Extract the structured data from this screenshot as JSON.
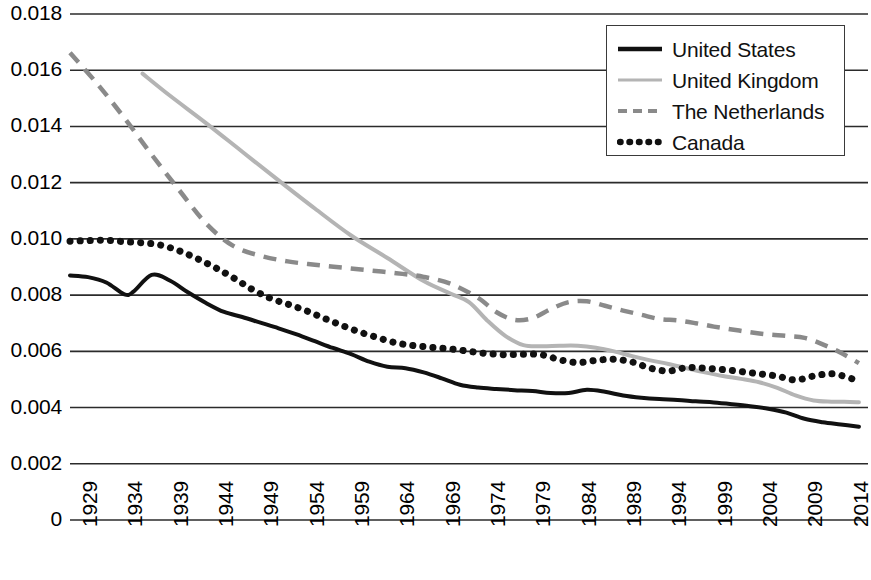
{
  "chart_data": {
    "type": "line",
    "title": "",
    "xlabel": "",
    "ylabel": "",
    "xlim": [
      1929,
      2017
    ],
    "ylim": [
      0,
      0.018
    ],
    "grid": "horizontal",
    "legend_position": "top-right",
    "x_ticks": [
      "1929",
      "1934",
      "1939",
      "1944",
      "1949",
      "1954",
      "1959",
      "1964",
      "1969",
      "1974",
      "1979",
      "1984",
      "1989",
      "1994",
      "1999",
      "2004",
      "2009",
      "2014"
    ],
    "y_ticks": [
      "0",
      "0.002",
      "0.004",
      "0.006",
      "0.008",
      "0.010",
      "0.012",
      "0.014",
      "0.016",
      "0.018"
    ],
    "series": [
      {
        "name": "United States",
        "style": "solid",
        "color": "#111111",
        "width": 4,
        "x": [
          1929,
          1931,
          1933,
          1935,
          1936,
          1938,
          1940,
          1942,
          1944,
          1946,
          1948,
          1950,
          1952,
          1954,
          1956,
          1958,
          1960,
          1962,
          1964,
          1966,
          1968,
          1970,
          1972,
          1974,
          1976,
          1978,
          1980,
          1982,
          1984,
          1986,
          1988,
          1990,
          1992,
          1994,
          1996,
          1998,
          2000,
          2002,
          2004,
          2006,
          2008,
          2010,
          2012,
          2014,
          2016
        ],
        "y": [
          0.0087,
          0.00864,
          0.00845,
          0.00803,
          0.00812,
          0.00872,
          0.00852,
          0.0081,
          0.00772,
          0.0074,
          0.00722,
          0.00702,
          0.00682,
          0.0066,
          0.00636,
          0.00612,
          0.0059,
          0.00563,
          0.00545,
          0.0054,
          0.00525,
          0.00504,
          0.00481,
          0.00471,
          0.00466,
          0.00462,
          0.00459,
          0.00452,
          0.00452,
          0.00463,
          0.00456,
          0.00443,
          0.00435,
          0.0043,
          0.00427,
          0.00422,
          0.00418,
          0.00412,
          0.00405,
          0.00396,
          0.00382,
          0.0036,
          0.00348,
          0.0034,
          0.00332
        ]
      },
      {
        "name": "United Kingdom",
        "style": "solid",
        "color": "#b4b4b4",
        "width": 4,
        "x": [
          1937,
          1940,
          1944,
          1948,
          1952,
          1956,
          1960,
          1964,
          1968,
          1971,
          1973,
          1975,
          1977,
          1979,
          1981,
          1983,
          1985,
          1987,
          1989,
          1991,
          1993,
          1995,
          1997,
          1999,
          2001,
          2003,
          2005,
          2007,
          2009,
          2011,
          2013,
          2015,
          2016
        ],
        "y": [
          0.01588,
          0.0151,
          0.01412,
          0.0131,
          0.01208,
          0.01108,
          0.01012,
          0.00932,
          0.0085,
          0.00805,
          0.00775,
          0.0071,
          0.00655,
          0.00622,
          0.00618,
          0.0062,
          0.0062,
          0.00613,
          0.006,
          0.00583,
          0.00568,
          0.00555,
          0.0054,
          0.00525,
          0.00512,
          0.00502,
          0.0049,
          0.0047,
          0.00443,
          0.00425,
          0.00421,
          0.0042,
          0.00419
        ]
      },
      {
        "name": "The Netherlands",
        "style": "dashed",
        "color": "#8a8a8a",
        "width": 4.5,
        "x": [
          1929,
          1932,
          1935,
          1938,
          1941,
          1944,
          1947,
          1950,
          1953,
          1956,
          1959,
          1962,
          1965,
          1968,
          1971,
          1974,
          1976,
          1978,
          1980,
          1982,
          1984,
          1986,
          1988,
          1990,
          1992,
          1994,
          1996,
          1998,
          2000,
          2002,
          2004,
          2006,
          2008,
          2010,
          2012,
          2014,
          2016
        ],
        "y": [
          0.01662,
          0.01552,
          0.0143,
          0.013,
          0.01175,
          0.01055,
          0.00975,
          0.0094,
          0.0092,
          0.00908,
          0.00898,
          0.00888,
          0.00878,
          0.00865,
          0.0084,
          0.0079,
          0.0074,
          0.00712,
          0.00718,
          0.0075,
          0.00775,
          0.00778,
          0.00762,
          0.00745,
          0.0073,
          0.00715,
          0.0071,
          0.007,
          0.00688,
          0.00678,
          0.00668,
          0.0066,
          0.00655,
          0.00648,
          0.00625,
          0.00595,
          0.00558
        ]
      },
      {
        "name": "Canada",
        "style": "dotted",
        "color": "#111111",
        "width": 7,
        "x": [
          1929,
          1931,
          1933,
          1935,
          1937,
          1939,
          1941,
          1943,
          1945,
          1947,
          1949,
          1951,
          1953,
          1955,
          1957,
          1959,
          1961,
          1963,
          1965,
          1967,
          1969,
          1971,
          1973,
          1975,
          1977,
          1979,
          1981,
          1983,
          1985,
          1987,
          1989,
          1991,
          1993,
          1995,
          1997,
          1999,
          2001,
          2003,
          2005,
          2007,
          2009,
          2011,
          2013,
          2015,
          2016
        ],
        "y": [
          0.00992,
          0.00994,
          0.00995,
          0.0099,
          0.00986,
          0.00978,
          0.00958,
          0.0093,
          0.00898,
          0.00862,
          0.00822,
          0.0079,
          0.00768,
          0.00745,
          0.00718,
          0.00692,
          0.00668,
          0.00648,
          0.0063,
          0.0062,
          0.00614,
          0.00608,
          0.006,
          0.00592,
          0.00588,
          0.0059,
          0.00588,
          0.0057,
          0.0056,
          0.00568,
          0.00572,
          0.00562,
          0.0054,
          0.0053,
          0.00542,
          0.0054,
          0.00535,
          0.00528,
          0.0052,
          0.00512,
          0.00498,
          0.00512,
          0.0052,
          0.00505,
          0.0049
        ]
      }
    ]
  },
  "legend": {
    "entries": [
      {
        "label": "United States",
        "swatch": "solid-black-line"
      },
      {
        "label": "United Kingdom",
        "swatch": "solid-gray-line"
      },
      {
        "label": "The Netherlands",
        "swatch": "dashed-gray-line"
      },
      {
        "label": "Canada",
        "swatch": "dotted-black-line"
      }
    ]
  }
}
